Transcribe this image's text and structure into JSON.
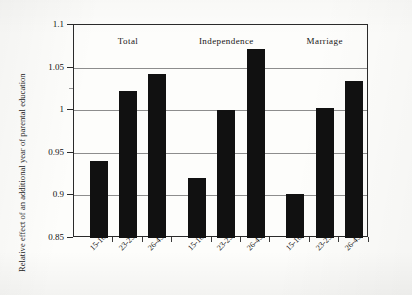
{
  "chart_data": {
    "type": "bar",
    "title": "",
    "xlabel": "",
    "ylabel": "Relative effect of an additional year of parental education",
    "ylim": [
      0.85,
      1.1
    ],
    "ytick_labels": [
      "0.85",
      "0.9",
      "0.95",
      "1",
      "1.05",
      "1.1"
    ],
    "ytick_values": [
      0.85,
      0.9,
      0.95,
      1.0,
      1.05,
      1.1
    ],
    "grid": true,
    "legend": "none",
    "categories": [
      "15-16",
      "23-25",
      "26-45"
    ],
    "groups": [
      {
        "name": "Total",
        "categories": [
          "15-16",
          "23-25",
          "26-45"
        ],
        "values": [
          0.94,
          1.022,
          1.042
        ]
      },
      {
        "name": "Independence",
        "categories": [
          "15-16",
          "23-25",
          "26-45"
        ],
        "values": [
          0.921,
          1.0,
          1.072
        ]
      },
      {
        "name": "Marriage",
        "categories": [
          "15-16",
          "23-25",
          "26-45"
        ],
        "values": [
          0.902,
          1.002,
          1.034
        ]
      }
    ],
    "colors": {
      "bar": "#111111",
      "gridline": "#8d8d8d",
      "frame": "#2a2a2a",
      "text": "#141414"
    }
  }
}
